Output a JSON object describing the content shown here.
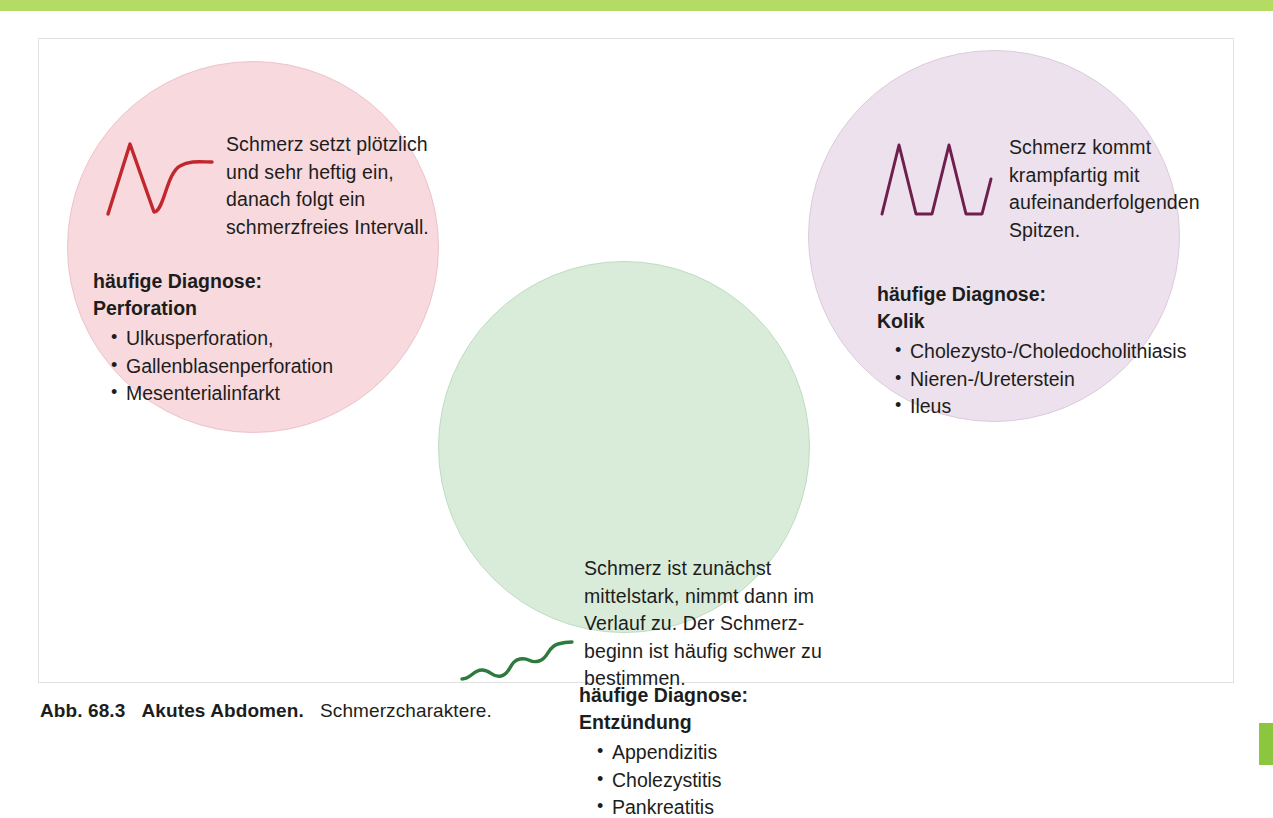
{
  "page": {
    "accent_bar_color": "#b4dc64",
    "corner_tab_color": "#8cc63e",
    "background_color": "#ffffff",
    "frame_border_color": "#e2e2e2"
  },
  "figure": {
    "caption": {
      "label": "Abb. 68.3",
      "title": "Akutes Abdomen.",
      "subtitle": "Schmerzcharaktere."
    },
    "bubbles": [
      {
        "id": "perforation",
        "fill_color": "#f7d9de",
        "border_color": "#edc3ca",
        "curve_color": "#c1272d",
        "curve_name": "sudden-peak-then-flat-waveform",
        "description": "Schmerz setzt plötzlich und sehr heftig ein, danach folgt ein schmerzfreies Intervall.",
        "diagnosis_heading": "häufige Diagnose:",
        "diagnosis_name": "Perforation",
        "items": [
          "Ulkusperforation,",
          "Gallenblasenperforation",
          "Mesenterialinfarkt"
        ]
      },
      {
        "id": "inflammation",
        "fill_color": "#d9ecda",
        "border_color": "#bedcc0",
        "curve_color": "#2d7a3e",
        "curve_name": "gradual-rising-wavy-waveform",
        "description": "Schmerz ist zunächst mittelstark, nimmt dann im Verlauf zu. Der Schmerz­beginn ist häufig schwer zu bestimmen.",
        "diagnosis_heading": "häufige Diagnose:",
        "diagnosis_name": "Entzündung",
        "items": [
          "Appendizitis",
          "Cholezystitis",
          "Pankreatitis"
        ]
      },
      {
        "id": "colic",
        "fill_color": "#ece1ec",
        "border_color": "#dccbdd",
        "curve_color": "#6e1f4e",
        "curve_name": "repeated-sharp-spikes-waveform",
        "description": "Schmerz kommt krampfartig mit aufeinanderfolgenden Spitzen.",
        "diagnosis_heading": "häufige Diagnose:",
        "diagnosis_name": "Kolik",
        "items": [
          "Cholezysto-/Choledocholithiasis",
          "Nieren-/Ureterstein",
          "Ileus"
        ]
      }
    ]
  }
}
